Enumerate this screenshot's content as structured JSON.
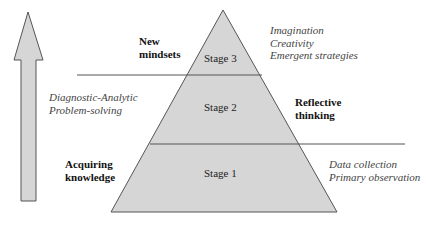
{
  "diagram": {
    "stages": [
      {
        "label": "Stage 3"
      },
      {
        "label": "Stage 2"
      },
      {
        "label": "Stage 1"
      }
    ],
    "left_labels": {
      "top": [
        "New",
        "mindsets"
      ],
      "middle": [
        "Diagnostic-Analytic",
        "Problem-solving"
      ],
      "bottom": [
        "Acquiring",
        "knowledge"
      ]
    },
    "right_labels": {
      "top": [
        "Imagination",
        "Creativity",
        "Emergent strategies"
      ],
      "middle": [
        "Reflective",
        "thinking"
      ],
      "bottom": [
        "Data collection",
        "Primary observation"
      ]
    },
    "colors": {
      "fill": "#d6d6d6",
      "stroke": "#555555"
    }
  }
}
